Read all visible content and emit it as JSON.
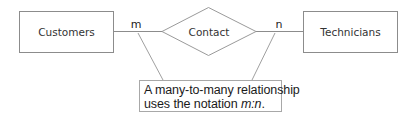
{
  "diagram": {
    "type": "entity-relationship",
    "entities": [
      {
        "id": "customers",
        "label": "Customers"
      },
      {
        "id": "technicians",
        "label": "Technicians"
      }
    ],
    "relationship": {
      "label": "Contact",
      "left_cardinality": "m",
      "right_cardinality": "n"
    },
    "callout": {
      "line1": "A many-to-many relationship",
      "line2_prefix": "uses the notation ",
      "notation": "m:n",
      "line2_suffix": "."
    },
    "colors": {
      "stroke": "#8c8c8c",
      "text": "#333333",
      "background": "#ffffff"
    }
  }
}
